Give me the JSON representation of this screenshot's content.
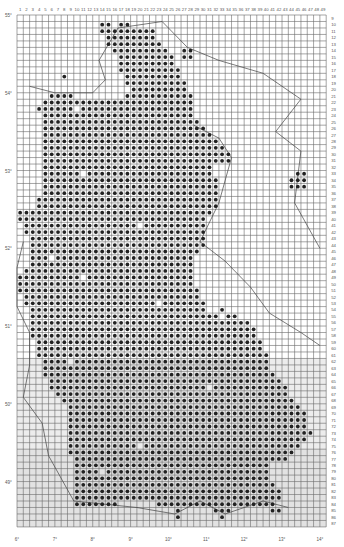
{
  "map": {
    "type": "grid distribution map",
    "grid": {
      "columns": 49,
      "first_row": 9,
      "last_row": 87,
      "origin_x": 17,
      "origin_y": 15,
      "cell_w": 6.31,
      "cell_h": 6.48,
      "line_color": "#6a6a6a",
      "dot_color": "#222222"
    },
    "column_labels": [
      "1",
      "2",
      "3",
      "4",
      "5",
      "6",
      "7",
      "8",
      "9",
      "10",
      "11",
      "12",
      "13",
      "14",
      "15",
      "16",
      "17",
      "18",
      "19",
      "20",
      "21",
      "22",
      "23",
      "24",
      "25",
      "26",
      "27",
      "28",
      "29",
      "30",
      "31",
      "32",
      "33",
      "34",
      "35",
      "36",
      "37",
      "38",
      "39",
      "40",
      "41",
      "42",
      "43",
      "44",
      "45",
      "46",
      "47",
      "48",
      "49"
    ],
    "row_labels": [
      "9",
      "10",
      "11",
      "12",
      "13",
      "14",
      "15",
      "16",
      "17",
      "18",
      "19",
      "20",
      "21",
      "22",
      "23",
      "24",
      "25",
      "26",
      "27",
      "28",
      "29",
      "30",
      "31",
      "32",
      "33",
      "34",
      "35",
      "36",
      "37",
      "38",
      "39",
      "40",
      "41",
      "42",
      "43",
      "44",
      "45",
      "46",
      "47",
      "48",
      "49",
      "50",
      "51",
      "52",
      "53",
      "54",
      "55",
      "56",
      "57",
      "58",
      "59",
      "60",
      "61",
      "62",
      "63",
      "64",
      "65",
      "66",
      "67",
      "68",
      "69",
      "70",
      "71",
      "72",
      "73",
      "74",
      "75",
      "76",
      "77",
      "78",
      "79",
      "80",
      "81",
      "82",
      "83",
      "84",
      "85",
      "86",
      "87"
    ],
    "latitude_labels": [
      {
        "text": "55°",
        "row": 9
      },
      {
        "text": "54°",
        "row": 21
      },
      {
        "text": "53°",
        "row": 33
      },
      {
        "text": "52°",
        "row": 45
      },
      {
        "text": "51°",
        "row": 57
      },
      {
        "text": "50°",
        "row": 69
      },
      {
        "text": "49°",
        "row": 81
      },
      {
        "text": "48°",
        "row": 93
      }
    ],
    "longitude_labels": [
      {
        "text": "6°",
        "col": 1
      },
      {
        "text": "7°",
        "col": 7
      },
      {
        "text": "8°",
        "col": 13
      },
      {
        "text": "9°",
        "col": 19
      },
      {
        "text": "10°",
        "col": 25
      },
      {
        "text": "11°",
        "col": 31
      },
      {
        "text": "12°",
        "col": 37
      },
      {
        "text": "13°",
        "col": 43
      },
      {
        "text": "14°",
        "col": 49
      }
    ],
    "dots_by_row": {
      "10": [
        [
          14,
          15
        ],
        [
          17,
          18
        ]
      ],
      "11": [
        [
          14,
          22
        ]
      ],
      "12": [
        [
          15,
          22
        ]
      ],
      "13": [
        [
          15,
          23
        ]
      ],
      "14": [
        [
          16,
          24
        ],
        [
          27,
          28
        ]
      ],
      "15": [
        [
          16,
          25
        ],
        [
          27,
          28
        ]
      ],
      "16": [
        [
          17,
          25
        ]
      ],
      "17": [
        [
          17,
          26
        ]
      ],
      "18": [
        [
          8,
          8
        ],
        [
          18,
          26
        ]
      ],
      "19": [
        [
          18,
          27
        ]
      ],
      "20": [
        [
          19,
          27
        ]
      ],
      "21": [
        [
          6,
          9
        ],
        [
          18,
          28
        ]
      ],
      "22": [
        [
          5,
          28
        ]
      ],
      "23": [
        [
          4,
          28
        ]
      ],
      "24": [
        [
          5,
          28
        ]
      ],
      "25": [
        [
          5,
          29
        ]
      ],
      "26": [
        [
          5,
          30
        ]
      ],
      "27": [
        [
          5,
          31
        ]
      ],
      "28": [
        [
          5,
          32
        ]
      ],
      "29": [
        [
          5,
          33
        ]
      ],
      "30": [
        [
          5,
          34
        ]
      ],
      "31": [
        [
          5,
          34
        ]
      ],
      "32": [
        [
          5,
          31
        ]
      ],
      "33": [
        [
          5,
          31
        ],
        [
          45,
          46
        ]
      ],
      "34": [
        [
          5,
          32
        ],
        [
          44,
          46
        ]
      ],
      "35": [
        [
          5,
          32
        ],
        [
          44,
          46
        ]
      ],
      "36": [
        [
          5,
          32
        ]
      ],
      "37": [
        [
          4,
          32
        ]
      ],
      "38": [
        [
          4,
          32
        ]
      ],
      "39": [
        [
          1,
          31
        ]
      ],
      "40": [
        [
          1,
          30
        ]
      ],
      "41": [
        [
          2,
          30
        ]
      ],
      "42": [
        [
          2,
          30
        ]
      ],
      "43": [
        [
          3,
          30
        ]
      ],
      "44": [
        [
          3,
          30
        ]
      ],
      "45": [
        [
          3,
          29
        ]
      ],
      "46": [
        [
          3,
          28
        ]
      ],
      "47": [
        [
          3,
          28
        ]
      ],
      "48": [
        [
          2,
          28
        ]
      ],
      "49": [
        [
          1,
          28
        ]
      ],
      "50": [
        [
          1,
          28
        ]
      ],
      "51": [
        [
          1,
          29
        ]
      ],
      "52": [
        [
          2,
          29
        ]
      ],
      "53": [
        [
          2,
          30
        ]
      ],
      "54": [
        [
          3,
          30
        ],
        [
          33,
          33
        ]
      ],
      "55": [
        [
          3,
          32
        ],
        [
          34,
          35
        ]
      ],
      "56": [
        [
          3,
          37
        ]
      ],
      "57": [
        [
          3,
          38
        ]
      ],
      "58": [
        [
          3,
          38
        ]
      ],
      "59": [
        [
          4,
          39
        ]
      ],
      "60": [
        [
          4,
          39
        ]
      ],
      "61": [
        [
          4,
          40
        ]
      ],
      "62": [
        [
          5,
          40
        ]
      ],
      "63": [
        [
          5,
          40
        ]
      ],
      "64": [
        [
          5,
          41
        ]
      ],
      "65": [
        [
          6,
          42
        ]
      ],
      "66": [
        [
          6,
          43
        ]
      ],
      "67": [
        [
          7,
          43
        ]
      ],
      "68": [
        [
          8,
          44
        ]
      ],
      "69": [
        [
          9,
          45
        ]
      ],
      "70": [
        [
          9,
          46
        ]
      ],
      "71": [
        [
          9,
          46
        ]
      ],
      "72": [
        [
          9,
          46
        ]
      ],
      "73": [
        [
          9,
          47
        ]
      ],
      "74": [
        [
          9,
          46
        ]
      ],
      "75": [
        [
          9,
          45
        ]
      ],
      "76": [
        [
          9,
          44
        ]
      ],
      "77": [
        [
          10,
          43
        ]
      ],
      "78": [
        [
          10,
          40
        ]
      ],
      "79": [
        [
          10,
          40
        ]
      ],
      "80": [
        [
          10,
          40
        ]
      ],
      "81": [
        [
          10,
          41
        ]
      ],
      "82": [
        [
          10,
          42
        ]
      ],
      "83": [
        [
          10,
          42
        ]
      ],
      "84": [
        [
          10,
          16
        ],
        [
          23,
          41
        ]
      ],
      "85": [
        [
          26,
          26
        ],
        [
          32,
          34
        ],
        [
          41,
          42
        ]
      ],
      "86": [
        [
          26,
          26
        ],
        [
          33,
          33
        ]
      ]
    },
    "empty_cells": [
      [
        16,
        15
      ],
      [
        10,
        23
      ],
      [
        14,
        19
      ],
      [
        11,
        33
      ],
      [
        20,
        41
      ],
      [
        6,
        46
      ],
      [
        11,
        49
      ],
      [
        9,
        62
      ],
      [
        23,
        53
      ],
      [
        14,
        79
      ],
      [
        20,
        75
      ],
      [
        31,
        66
      ]
    ]
  }
}
